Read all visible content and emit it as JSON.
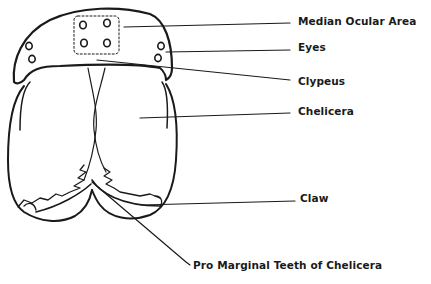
{
  "diagram": {
    "labels": [
      {
        "id": "median-ocular-area",
        "text": "Median Ocular Area",
        "x": 298,
        "y": 15
      },
      {
        "id": "eyes",
        "text": "Eyes",
        "x": 298,
        "y": 41
      },
      {
        "id": "clypeus",
        "text": "Clypeus",
        "x": 298,
        "y": 75
      },
      {
        "id": "chelicera",
        "text": "Chelicera",
        "x": 298,
        "y": 105
      },
      {
        "id": "claw",
        "text": "Claw",
        "x": 300,
        "y": 192
      },
      {
        "id": "pro-marginal-teeth",
        "text": "Pro Marginal Teeth of Chelicera",
        "x": 193,
        "y": 261
      }
    ],
    "stroke_color": "#1a1a1a",
    "background_color": "#ffffff"
  }
}
